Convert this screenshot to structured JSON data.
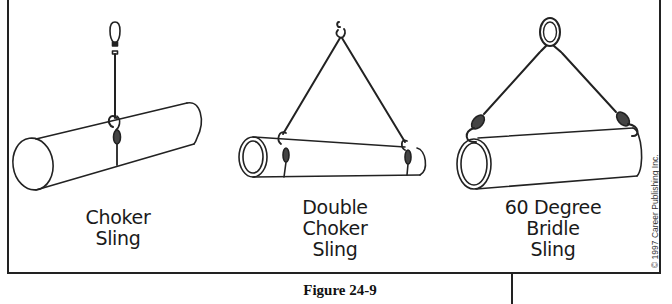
{
  "figure": {
    "caption": "Figure 24-9",
    "copyright": "© 1997 Career Publishing Inc."
  },
  "slings": [
    {
      "id": "choker",
      "label_lines": [
        "Choker",
        "Sling"
      ]
    },
    {
      "id": "double-choker",
      "label_lines": [
        "Double",
        "Choker",
        "Sling"
      ]
    },
    {
      "id": "bridle-60",
      "label_lines": [
        "60 Degree",
        "Bridle",
        "Sling"
      ]
    }
  ],
  "colors": {
    "line": "#222222",
    "background": "#ffffff"
  }
}
